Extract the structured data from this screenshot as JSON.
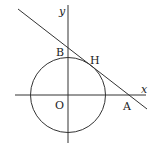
{
  "diagram": {
    "title": "",
    "type": "geometry",
    "colors": {
      "stroke": "#333333",
      "text": "#222222",
      "background": "#ffffff"
    },
    "axes": {
      "x_label": "x",
      "y_label": "y",
      "origin_label": "O"
    },
    "points": {
      "A": "A",
      "B": "B",
      "H": "H"
    },
    "elements": [
      {
        "kind": "circle",
        "center": "O",
        "description": "circle centered at origin"
      },
      {
        "kind": "line",
        "through": [
          "B",
          "H",
          "A"
        ],
        "description": "tangent line touching circle at H, crossing y-axis at B and x-axis at A"
      }
    ]
  }
}
